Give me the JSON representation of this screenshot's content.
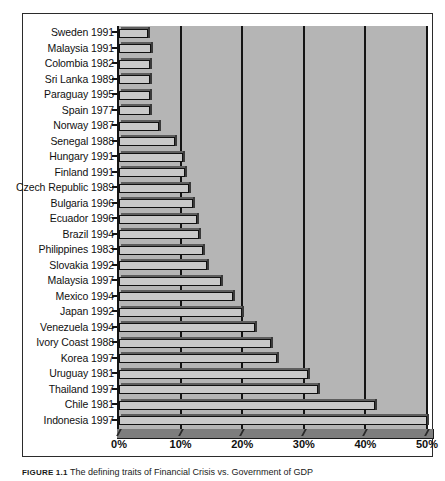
{
  "figure": {
    "caption_id": "FIGURE 1.1",
    "caption_text": "The defining traits of Financial Crisis vs. Government of GDP"
  },
  "chart_data": {
    "type": "bar",
    "orientation": "horizontal",
    "title": "",
    "xlabel": "",
    "ylabel": "",
    "xlim": [
      0,
      50
    ],
    "xticks": [
      0,
      10,
      20,
      30,
      40,
      50
    ],
    "xticklabels": [
      "0%",
      "10%",
      "20%",
      "30%",
      "40%",
      "50%"
    ],
    "grid": true,
    "grid_axis": "x",
    "legend": null,
    "bar_color": "#c9c9c9",
    "plot_background": "#b5b5b5",
    "categories": [
      "Sweden 1991",
      "Malaysia 1991",
      "Colombia 1982",
      "Sri Lanka 1989",
      "Paraguay 1995",
      "Spain 1977",
      "Norway 1987",
      "Senegal 1988",
      "Hungary 1991",
      "Finland 1991",
      "Czech Republic 1989",
      "Bulgaria 1996",
      "Ecuador 1996",
      "Brazil 1994",
      "Philippines 1983",
      "Slovakia 1992",
      "Malaysia 1997",
      "Mexico 1994",
      "Japan 1992",
      "Venezuela 1994",
      "Ivory Coast 1988",
      "Korea 1997",
      "Uruguay 1981",
      "Thailand 1997",
      "Chile 1981",
      "Indonesia 1997"
    ],
    "values": [
      4.7,
      5.2,
      5.0,
      5.0,
      5.1,
      5.0,
      6.5,
      9.1,
      10.4,
      10.7,
      11.4,
      12.0,
      12.6,
      13.0,
      13.6,
      14.3,
      16.6,
      18.5,
      20.0,
      22.0,
      24.7,
      25.6,
      30.7,
      32.3,
      41.6,
      50.0
    ]
  }
}
